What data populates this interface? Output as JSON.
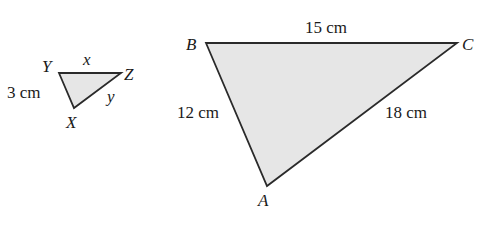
{
  "small_triangle": {
    "vertices": {
      "Y": "Y",
      "Z": "Z",
      "X": "X"
    },
    "sides": {
      "YZ": "x",
      "ZX": "y",
      "YX": "3 cm"
    }
  },
  "large_triangle": {
    "vertices": {
      "B": "B",
      "C": "C",
      "A": "A"
    },
    "sides": {
      "BC": "15 cm",
      "BA": "12 cm",
      "CA": "18 cm"
    }
  },
  "colors": {
    "fill": "#e6e6e6",
    "stroke": "#2a2a2a"
  }
}
